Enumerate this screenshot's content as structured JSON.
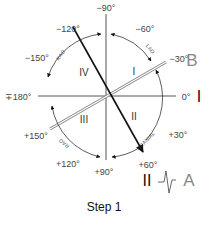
{
  "diagram": {
    "caption": "Step 1",
    "angle_labels": {
      "m90": "−90°",
      "m60": "−60°",
      "m30": "−30°",
      "zero": "0°",
      "p30": "+30°",
      "p60": "+60°",
      "p90": "+90°",
      "p120": "+120°",
      "p150": "+150°",
      "pm180": "∓180°",
      "m150": "−150°",
      "m120": "−120°"
    },
    "quadrants": {
      "q1": "I",
      "q2": "II",
      "q3": "III",
      "q4": "IV"
    },
    "arc_labels": {
      "top_left": "RAO",
      "top_right": "LAO",
      "bottom_left": "RAO",
      "bottom_right": "CRANIAL"
    },
    "axis_markers": {
      "B": "B",
      "lead_I": "I",
      "lead_II": "II",
      "A": "A"
    },
    "colors": {
      "line": "#111111",
      "axis": "#555555",
      "arc": "#333333",
      "double_line": "#999999"
    }
  }
}
